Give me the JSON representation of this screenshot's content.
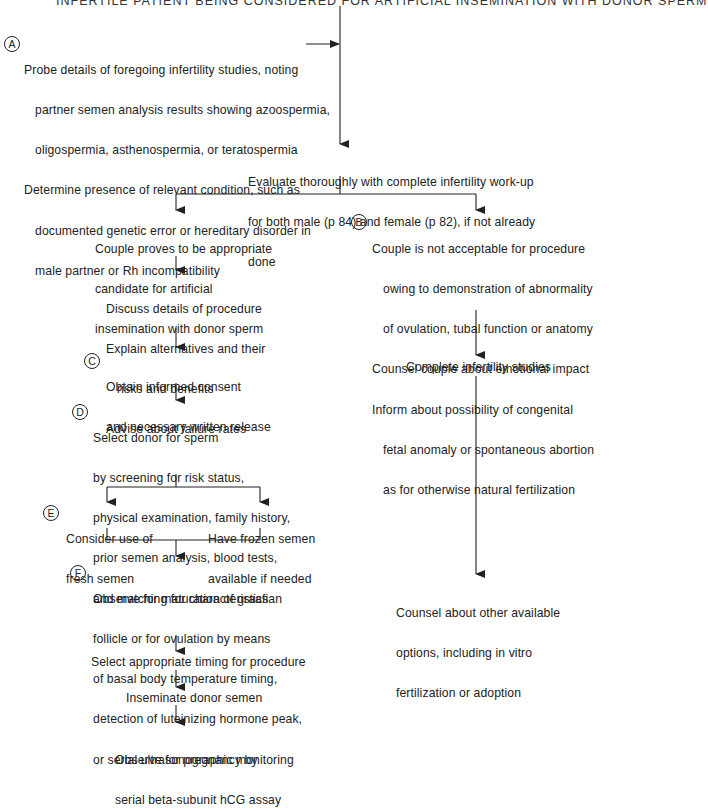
{
  "header": {
    "title": "INFERTILE PATIENT BEING CONSIDERED FOR ARTIFICIAL INSEMINATION WITH DONOR SPERM"
  },
  "nodes": {
    "A": {
      "label": "A",
      "lines": [
        "Probe details of foregoing infertility studies, noting",
        "partner semen analysis results showing azoospermia,",
        "oligospermia, asthenospermia, or teratospermia",
        "Determine presence of relevant condition, such as",
        "documented genetic error or hereditary disorder in",
        "male partner or Rh incompatibility"
      ]
    },
    "evaluate": {
      "lines": [
        "Evaluate thoroughly with complete infertility work-up",
        "for both male (p 84) and female (p 82), if not already",
        "done"
      ]
    },
    "appropriate": {
      "lines": [
        "Couple proves to be appropriate",
        "candidate for artificial",
        "insemination with donor sperm"
      ]
    },
    "B": {
      "label": "B",
      "lines": [
        "Couple is not acceptable for procedure",
        "owing to demonstration of abnormality",
        "of ovulation, tubal function or anatomy",
        "Counsel couple about emotional impact",
        "Inform about possibility of congenital",
        "fetal anomaly or spontaneous abortion",
        "as for otherwise natural fertilization"
      ]
    },
    "discuss": {
      "lines": [
        "Discuss details of procedure",
        "Explain alternatives and their",
        "risks and benefits",
        "Advise about failure rates"
      ]
    },
    "C": {
      "label": "C",
      "lines": [
        "Obtain informed consent",
        "and necessary written release"
      ]
    },
    "D": {
      "label": "D",
      "lines": [
        "Select donor for sperm",
        "by screening for risk status,",
        "physical examination, family history,",
        "prior semen analysis, blood tests,",
        "and matching for characteristics"
      ]
    },
    "E": {
      "label": "E",
      "lines": [
        "Consider use of",
        "fresh semen"
      ]
    },
    "frozen": {
      "lines": [
        "Have frozen semen",
        "available if needed"
      ]
    },
    "F": {
      "label": "F",
      "lines": [
        "Observe for maturation of graafian",
        "follicle or for ovulation by means",
        "of basal body temperature timing,",
        "detection of luteinizing hormone peak,",
        "or serial ultrasonographic monitoring"
      ]
    },
    "timing": {
      "lines": [
        "Select appropriate timing for procedure"
      ]
    },
    "inseminate": {
      "lines": [
        "Inseminate donor semen"
      ]
    },
    "pregnancy": {
      "lines": [
        "Observe for pregnancy by",
        "serial beta-subunit hCG assay"
      ]
    },
    "complete": {
      "lines": [
        "Complete infertility studies"
      ]
    },
    "counsel_other": {
      "lines": [
        "Counsel about other available",
        "options, including in vitro",
        "fertilization or adoption"
      ]
    }
  },
  "colors": {
    "ink": "#222222",
    "background": "#ffffff"
  }
}
